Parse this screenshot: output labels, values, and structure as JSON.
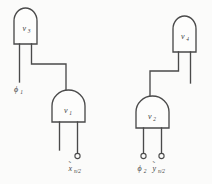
{
  "figure": {
    "kind": "logic-circuit-schematic",
    "background_color": "#fbfbfa",
    "ink_color": "#4a4a4a"
  },
  "gates": [
    {
      "id": "v3",
      "label": "v",
      "subscript": "3",
      "x": 14,
      "y": 8,
      "w": 23,
      "h": 36
    },
    {
      "id": "v1",
      "label": "v",
      "subscript": "1",
      "x": 52,
      "y": 90,
      "w": 33,
      "h": 32
    },
    {
      "id": "v4",
      "label": "v",
      "subscript": "4",
      "x": 173,
      "y": 16,
      "w": 23,
      "h": 36
    },
    {
      "id": "v2",
      "label": "v",
      "subscript": "2",
      "x": 136,
      "y": 96,
      "w": 33,
      "h": 32
    }
  ],
  "ports": [
    {
      "id": "phi1",
      "label": "ϕ",
      "subscript": "1",
      "tilde": false,
      "terminal": false,
      "x": 20,
      "y": 88
    },
    {
      "id": "x",
      "label": "x",
      "subscript": "n/2",
      "tilde": true,
      "terminal": true,
      "x": 77,
      "y": 157
    },
    {
      "id": "phi2",
      "label": "ϕ",
      "subscript": "2",
      "tilde": false,
      "terminal": true,
      "x": 141,
      "y": 163
    },
    {
      "id": "y",
      "label": "y",
      "subscript": "n/2",
      "tilde": true,
      "terminal": true,
      "x": 162,
      "y": 163
    }
  ],
  "labels": {
    "v3": "v",
    "v3_sub": "3",
    "v1": "v",
    "v1_sub": "1",
    "v4": "v",
    "v4_sub": "4",
    "v2": "v",
    "v2_sub": "2",
    "phi1": "ϕ",
    "phi1_sub": "1",
    "phi2": "ϕ",
    "phi2_sub": "2",
    "x": "x",
    "x_sub": "n/2",
    "y": "y",
    "y_sub": "n/2",
    "tilde": "˜"
  }
}
